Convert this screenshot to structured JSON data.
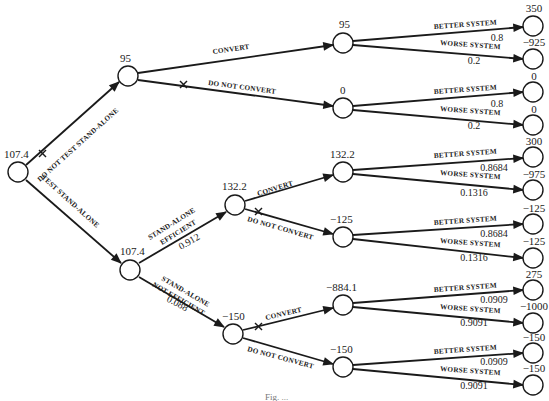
{
  "diagram": {
    "type": "decision-tree",
    "caption": "Fig. ...",
    "nodes": {
      "root": {
        "value": "107.4",
        "x": 18,
        "y": 172
      },
      "d_no_test": {
        "value": "95",
        "x": 128,
        "y": 76
      },
      "c_test": {
        "value": "107.4",
        "x": 130,
        "y": 270
      },
      "d_efficient": {
        "value": "132.2",
        "x": 235,
        "y": 205
      },
      "d_not_efficient": {
        "value": "−150",
        "x": 233,
        "y": 334
      },
      "c1": {
        "value": "95",
        "x": 343,
        "y": 43
      },
      "c2": {
        "value": "0",
        "x": 343,
        "y": 108
      },
      "c3": {
        "value": "132.2",
        "x": 343,
        "y": 172
      },
      "c4": {
        "value": "−125",
        "x": 343,
        "y": 237
      },
      "c5": {
        "value": "−884.1",
        "x": 343,
        "y": 305
      },
      "c6": {
        "value": "−150",
        "x": 343,
        "y": 367
      }
    },
    "branches": {
      "do_not_test": "DO NOT TEST STAND-ALONE",
      "test": "TEST STAND-ALONE",
      "convert": "CONVERT",
      "do_not_convert": "DO NOT CONVERT",
      "efficient_1": "STAND-ALONE",
      "efficient_2": "EFFICIENT",
      "efficient_p": "0.912",
      "not_efficient_1": "STAND-ALONE",
      "not_efficient_2": "NOT EFFICIENT",
      "not_efficient_p": "0.088",
      "better": "BETTER SYSTEM",
      "worse": "WORSE SYSTEM"
    },
    "outcomes": [
      {
        "parent": "c1",
        "better_p": "0.8",
        "worse_p": "0.2",
        "better_val": "350",
        "worse_val": "−925"
      },
      {
        "parent": "c2",
        "better_p": "0.8",
        "worse_p": "0.2",
        "better_val": "0",
        "worse_val": "0"
      },
      {
        "parent": "c3",
        "better_p": "0.8684",
        "worse_p": "0.1316",
        "better_val": "300",
        "worse_val": "−975"
      },
      {
        "parent": "c4",
        "better_p": "0.8684",
        "worse_p": "0.1316",
        "better_val": "−125",
        "worse_val": "−125"
      },
      {
        "parent": "c5",
        "better_p": "0.0909",
        "worse_p": "0.9091",
        "better_val": "275",
        "worse_val": "−1000"
      },
      {
        "parent": "c6",
        "better_p": "0.0909",
        "worse_p": "0.9091",
        "better_val": "−150",
        "worse_val": "−150"
      }
    ]
  }
}
